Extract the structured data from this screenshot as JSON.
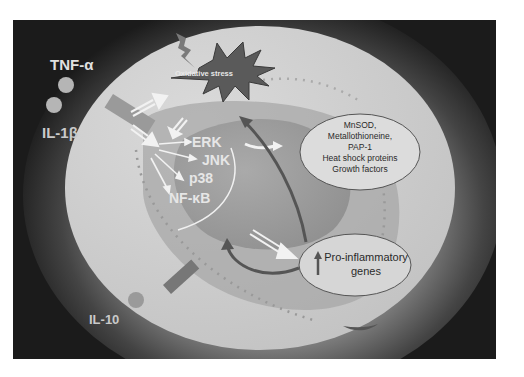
{
  "diagram": {
    "type": "cell-signaling",
    "extracellular": {
      "cytokines": [
        {
          "label": "TNF-α"
        },
        {
          "label": "IL-1β"
        },
        {
          "label": "IL-10"
        }
      ]
    },
    "stress": {
      "label": "Oxidative stress"
    },
    "kinases": [
      {
        "label": "ERK"
      },
      {
        "label": "JNK"
      },
      {
        "label": "p38"
      },
      {
        "label": "NF-κB"
      }
    ],
    "protective_genes": {
      "lines": [
        "MnSOD,",
        "Metallothioneine,",
        "PAP-1",
        "Heat shock proteins",
        "Growth factors"
      ]
    },
    "inflammatory_genes": {
      "arrow": "up-arrow-icon",
      "line1": "Pro-inflammatory",
      "line2": "genes"
    },
    "colors": {
      "background": "#1b1b1b",
      "cell": "#cfcfcf",
      "cytoplasm_inner": "#9c9c9c",
      "nucleus": "#8a8a8a",
      "starburst": "#5a5a5a",
      "arrows_white": "#f2f2f2",
      "arrows_dark": "#555555",
      "ellipse_fill": "#dcdcdc",
      "ellipse_stroke": "#555555"
    }
  }
}
